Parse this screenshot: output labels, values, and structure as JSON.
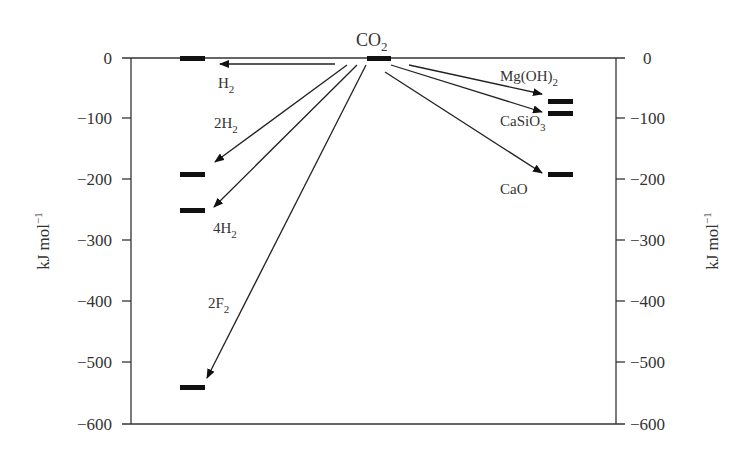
{
  "diagram": {
    "type": "energy-level-diagram",
    "y_axis": {
      "label": "kJ mol",
      "label_sup": "−1",
      "ticks": [
        "0",
        "−100",
        "−200",
        "−300",
        "−400",
        "−500",
        "−600"
      ],
      "tick_values": [
        0,
        -100,
        -200,
        -300,
        -400,
        -500,
        -600
      ],
      "range": [
        -600,
        0
      ]
    },
    "reactant": {
      "label": "CO",
      "label_sub": "2",
      "energy": 0
    },
    "left_products": [
      {
        "label": "H",
        "sub": "2",
        "prefix": "",
        "energy": 0
      },
      {
        "label": "H",
        "sub": "2",
        "prefix": "2",
        "energy": -190
      },
      {
        "label": "H",
        "sub": "2",
        "prefix": "4",
        "energy": -250
      },
      {
        "label": "F",
        "sub": "2",
        "prefix": "2",
        "energy": -540
      }
    ],
    "right_products": [
      {
        "label": "Mg(OH)",
        "sub": "2",
        "energy": -72
      },
      {
        "label": "CaSiO",
        "sub": "3",
        "energy": -90
      },
      {
        "label": "CaO",
        "sub": "",
        "energy": -190
      }
    ]
  },
  "labels": {
    "co2": "CO",
    "co2_sub": "2",
    "h2": "H",
    "h2_sub": "2",
    "h2x2_prefix": "2H",
    "h2x2_sub": "2",
    "h2x4_prefix": "4H",
    "h2x4_sub": "2",
    "f2x2_prefix": "2F",
    "f2x2_sub": "2",
    "mgoh2": "Mg(OH)",
    "mgoh2_sub": "2",
    "casio3": "CaSiO",
    "casio3_sub": "3",
    "cao": "CaO"
  },
  "colors": {
    "line": "#333333",
    "bar": "#111111",
    "background": "#ffffff"
  }
}
